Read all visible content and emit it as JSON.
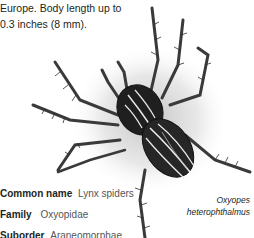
{
  "intro": {
    "line1": "Europe. Body length up to",
    "line2": "0.3 inches (8 mm)."
  },
  "illustration": {
    "subject": "lynx-spider-illustration",
    "caption_line1": "Oxyopes",
    "caption_line2": "heterophthalmus"
  },
  "facts": [
    {
      "label": "Common name",
      "value": "Lynx spiders"
    },
    {
      "label": "Family",
      "value": "Oxyopidae"
    },
    {
      "label": "Suborder",
      "value": "Araneomorphae"
    }
  ],
  "colors": {
    "text": "#231f20",
    "value_text": "#555555",
    "background": "#ffffff"
  }
}
